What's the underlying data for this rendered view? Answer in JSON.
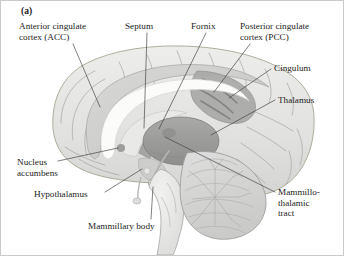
{
  "figure": {
    "panel_letter": "(a)",
    "labels": [
      {
        "id": "acc",
        "name": "Anterior cingulate cortex (ACC)",
        "lines": [
          "Anterior cingulate",
          "cortex (ACC)"
        ],
        "x": 18,
        "y": 20,
        "align": "left"
      },
      {
        "id": "septum",
        "name": "Septum",
        "lines": [
          "Septum"
        ],
        "x": 124,
        "y": 20,
        "align": "left"
      },
      {
        "id": "fornix",
        "name": "Fornix",
        "lines": [
          "Fornix"
        ],
        "x": 190,
        "y": 20,
        "align": "left"
      },
      {
        "id": "pcc",
        "name": "Posterior cingulate cortex (PCC)",
        "lines": [
          "Posterior cingulate",
          "cortex (PCC)"
        ],
        "x": 239,
        "y": 20,
        "align": "left"
      },
      {
        "id": "cingulum",
        "name": "Cingulum",
        "lines": [
          "Cingulum"
        ],
        "x": 273,
        "y": 62,
        "align": "left"
      },
      {
        "id": "thalamus",
        "name": "Thalamus",
        "lines": [
          "Thalamus"
        ],
        "x": 277,
        "y": 94,
        "align": "left"
      },
      {
        "id": "mtt",
        "name": "Mammillo-thalamic tract",
        "lines": [
          "Mammillo-",
          "thalamic",
          "tract"
        ],
        "x": 277,
        "y": 186,
        "align": "left"
      },
      {
        "id": "nacc",
        "name": "Nucleus accumbens",
        "lines": [
          "Nucleus",
          "accumbens"
        ],
        "x": 16,
        "y": 156,
        "align": "left"
      },
      {
        "id": "hypothal",
        "name": "Hypothalamus",
        "lines": [
          "Hypothalamus"
        ],
        "x": 33,
        "y": 188,
        "align": "left"
      },
      {
        "id": "mambody",
        "name": "Mammillary body",
        "lines": [
          "Mammillary body"
        ],
        "x": 87,
        "y": 220,
        "align": "left"
      }
    ],
    "structures": [
      {
        "id": "cerebral-cortex",
        "name": "Cerebral cortex (midsagittal)"
      },
      {
        "id": "cingulate-gyrus",
        "name": "Cingulate gyrus band"
      },
      {
        "id": "corpus-callosum",
        "name": "Corpus callosum"
      },
      {
        "id": "thalamus-body",
        "name": "Thalamus"
      },
      {
        "id": "pcc-patch",
        "name": "Posterior cingulate cortex patch"
      },
      {
        "id": "cingulum-bundle",
        "name": "Cingulum bundle"
      },
      {
        "id": "fornix-arc",
        "name": "Fornix"
      },
      {
        "id": "septum-region",
        "name": "Septum"
      },
      {
        "id": "nucleus-accumbens-dot",
        "name": "Nucleus accumbens"
      },
      {
        "id": "hypothalamus-region",
        "name": "Hypothalamus"
      },
      {
        "id": "mammillary-body-dot",
        "name": "Mammillary body"
      },
      {
        "id": "cerebellum",
        "name": "Cerebellum"
      },
      {
        "id": "brainstem",
        "name": "Brainstem"
      }
    ],
    "colors": {
      "background": "#ffffff",
      "frame_border": "#c9c9c9",
      "cortex_fill": "#e3e3e1",
      "cortex_stroke": "#9a9a98",
      "cingulate_fill": "#cfcfcd",
      "corpus_callosum_fill": "#fbfbfa",
      "thalamus_fill": "#9c9c9a",
      "pcc_fill": "#a8a8a6",
      "cingulum_fill": "#8f8f8d",
      "cerebellum_fill": "#d6d6d4",
      "leader_line": "#3a3a3a",
      "text": "#1c1c1c"
    }
  }
}
